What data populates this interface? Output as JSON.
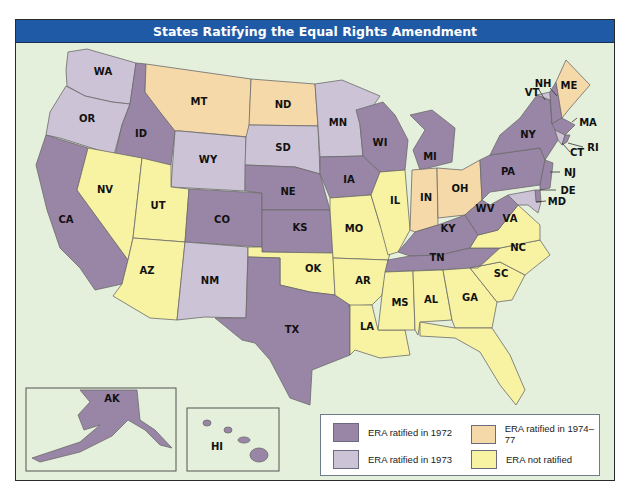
{
  "title": "States Ratifying the Equal Rights Amendment",
  "colors": {
    "ratified_1972": "#9985a6",
    "ratified_1973": "#cdc3d6",
    "ratified_1974_77": "#f6d9a8",
    "not_ratified": "#f8f3a2",
    "water": "#e4efdc",
    "title_bar": "#1f5aa6"
  },
  "legend": {
    "items": [
      {
        "key": "ratified_1972",
        "label": "ERA ratified in 1972"
      },
      {
        "key": "ratified_1974_77",
        "label": "ERA ratified in 1974–77"
      },
      {
        "key": "ratified_1973",
        "label": "ERA ratified in 1973"
      },
      {
        "key": "not_ratified",
        "label": "ERA not ratified"
      }
    ]
  },
  "states": {
    "ratified_1972": [
      "ID",
      "CA",
      "CO",
      "NE",
      "KS",
      "IA",
      "WI",
      "MI",
      "NY",
      "PA",
      "NJ",
      "DE",
      "MD",
      "MA",
      "NH",
      "RI",
      "WV",
      "KY",
      "TN",
      "TX",
      "AK",
      "HI"
    ],
    "ratified_1973": [
      "WA",
      "OR",
      "WY",
      "SD",
      "MN",
      "NM",
      "VT",
      "CT"
    ],
    "ratified_1974_77": [
      "MT",
      "ND",
      "IN",
      "OH",
      "ME"
    ],
    "not_ratified": [
      "NV",
      "UT",
      "AZ",
      "OK",
      "MO",
      "AR",
      "LA",
      "IL",
      "MS",
      "AL",
      "GA",
      "SC",
      "NC",
      "VA",
      "FL"
    ]
  },
  "labels": {
    "WA": "WA",
    "OR": "OR",
    "CA": "CA",
    "ID": "ID",
    "NV": "NV",
    "MT": "MT",
    "WY": "WY",
    "UT": "UT",
    "AZ": "AZ",
    "CO": "CO",
    "NM": "NM",
    "ND": "ND",
    "SD": "SD",
    "NE": "NE",
    "KS": "KS",
    "OK": "OK",
    "TX": "TX",
    "MN": "MN",
    "IA": "IA",
    "MO": "MO",
    "AR": "AR",
    "LA": "LA",
    "WI": "WI",
    "IL": "IL",
    "MI": "MI",
    "IN": "IN",
    "OH": "OH",
    "KY": "KY",
    "TN": "TN",
    "MS": "MS",
    "AL": "AL",
    "GA": "GA",
    "FL": "FL",
    "SC": "SC",
    "NC": "NC",
    "VA": "VA",
    "WV": "WV",
    "PA": "PA",
    "NY": "NY",
    "VT": "VT",
    "NH": "NH",
    "ME": "ME",
    "MA": "MA",
    "RI": "RI",
    "CT": "CT",
    "NJ": "NJ",
    "DE": "DE",
    "MD": "MD",
    "AK": "AK",
    "HI": "HI"
  }
}
